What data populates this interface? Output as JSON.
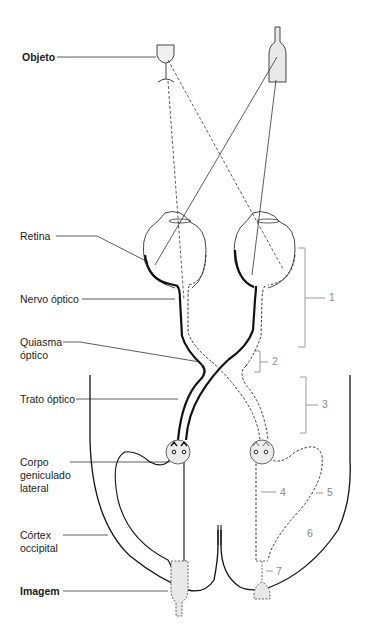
{
  "diagram": {
    "type": "visual-pathway",
    "labels": {
      "object": "Objeto",
      "retina": "Retina",
      "optic_nerve": "Nervo óptico",
      "optic_chiasm_line1": "Quiasma",
      "optic_chiasm_line2": "óptico",
      "optic_tract": "Trato óptico",
      "lgn_line1": "Corpo",
      "lgn_line2": "geniculado",
      "lgn_line3": "lateral",
      "cortex_line1": "Córtex",
      "cortex_line2": "occipital",
      "image": "Imagem"
    },
    "numbers": {
      "n1": "1",
      "n2": "2",
      "n3": "3",
      "n4": "4",
      "n5": "5",
      "n6": "6",
      "n7": "7"
    },
    "objects": [
      "wine-glass",
      "bottle"
    ],
    "colors": {
      "line": "#1a1a1a",
      "annotation_gray": "#8a8a8a",
      "fill_gray": "#e8e8e8"
    }
  }
}
